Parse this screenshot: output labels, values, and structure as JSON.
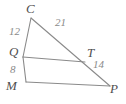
{
  "figure": {
    "type": "geometry-diagram",
    "background_color": "#ffffff",
    "line_color": "#8a8a8a",
    "label_color": "#4f4f4f",
    "measure_color": "#8a8a8a",
    "vertices": [
      {
        "id": "C",
        "label": "C",
        "x": 31,
        "y": 18
      },
      {
        "id": "Q",
        "label": "Q",
        "x": 23,
        "y": 57
      },
      {
        "id": "M",
        "label": "M",
        "x": 26,
        "y": 82
      },
      {
        "id": "T",
        "label": "T",
        "x": 85,
        "y": 62
      },
      {
        "id": "P",
        "label": "P",
        "x": 110,
        "y": 86
      }
    ],
    "segments": [
      {
        "id": "CQ",
        "from": "C",
        "to": "Q"
      },
      {
        "id": "QM",
        "from": "Q",
        "to": "M"
      },
      {
        "id": "CP",
        "from": "C",
        "to": "P"
      },
      {
        "id": "QT",
        "from": "Q",
        "to": "T"
      },
      {
        "id": "MP",
        "from": "M",
        "to": "P"
      }
    ],
    "measures": [
      {
        "id": "CQ-length",
        "segment": "CQ",
        "value": "12"
      },
      {
        "id": "QM-length",
        "segment": "QM",
        "value": "8"
      },
      {
        "id": "CT-length",
        "segment": "CT",
        "value": "21"
      },
      {
        "id": "TP-length",
        "segment": "TP",
        "value": "14"
      }
    ]
  }
}
